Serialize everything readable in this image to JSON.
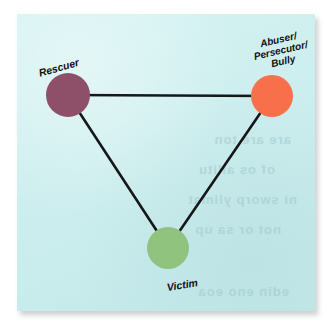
{
  "diagram": {
    "background_color": "#ccf0f0",
    "edge_color": "#17171a",
    "nodes": [
      {
        "id": "rescuer",
        "label": "Rescuer",
        "color": "#8e4f68",
        "cx": 68,
        "cy": 95,
        "r": 22
      },
      {
        "id": "abuser",
        "label_line1": "Abuser/",
        "label_line2": "Persecutor/",
        "label_line3": "Bully",
        "color": "#f86f4b",
        "cx": 272,
        "cy": 96,
        "r": 21
      },
      {
        "id": "victim",
        "label": "Victim",
        "color": "#90c47e",
        "cx": 168,
        "cy": 248,
        "r": 21
      }
    ],
    "edges": [
      {
        "id": "rescuer-abuser",
        "from": "rescuer",
        "to": "abuser"
      },
      {
        "id": "rescuer-victim",
        "from": "rescuer",
        "to": "victim"
      },
      {
        "id": "abuser-victim",
        "from": "abuser",
        "to": "victim"
      }
    ]
  },
  "showthrough": {
    "line1": "are are ton",
    "line2": "of os allitu",
    "line3": "ni sworp ylimat",
    "line4": "not or sa up",
    "line5": "edin eno eoa",
    "line6": "ont ent oloe"
  }
}
